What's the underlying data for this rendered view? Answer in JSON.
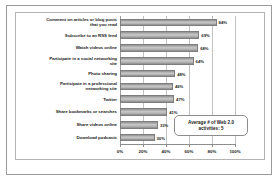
{
  "chart_data": {
    "type": "bar",
    "orientation": "horizontal",
    "title": "",
    "xlabel": "",
    "ylabel": "",
    "xlim": [
      0,
      100
    ],
    "grid": true,
    "legend": false,
    "xticks": [
      "0%",
      "20%",
      "40%",
      "60%",
      "80%",
      "100%"
    ],
    "xtick_values": [
      0,
      20,
      40,
      60,
      80,
      100
    ],
    "categories": [
      "Comment on articles or blog posts that you read",
      "Subscribe to an RSS feed",
      "Watch videos online",
      "Participate in a social networking site",
      "Photo sharing",
      "Participate in a professional networking site",
      "Twitter",
      "Share bookmarks or searches",
      "Share videos online",
      "Download podcasts"
    ],
    "values": [
      84,
      69,
      68,
      64,
      48,
      46,
      47,
      41,
      33,
      30
    ],
    "value_labels": [
      "84%",
      "69%",
      "68%",
      "64%",
      "48%",
      "46%",
      "47%",
      "41%",
      "33%",
      "30%"
    ],
    "annotations": [
      {
        "text": "Average # of Web 2.0 activities: 5",
        "line1": "Average # of Web 2.0",
        "line2": "activities: 5"
      }
    ],
    "colors": {
      "bar_light": "#c9c9c9",
      "bar_dark": "#8b8b8b",
      "bar_edge": "#7d7d7d",
      "gridline": "#c2c2c2",
      "axis": "#8d8d8d",
      "text": "#1b1b1b",
      "background": "#ffffff",
      "border": "#9a9a9a"
    }
  },
  "category_label_lines": [
    [
      "Comment on articles or blog posts",
      "that you read"
    ],
    [
      "Subscribe to an RSS feed"
    ],
    [
      "Watch videos online"
    ],
    [
      "Participate in a social networking",
      "site"
    ],
    [
      "Photo sharing"
    ],
    [
      "Participate in a professional",
      "networking site"
    ],
    [
      "Twitter"
    ],
    [
      "Share bookmarks or searches"
    ],
    [
      "Share videos online"
    ],
    [
      "Download podcasts"
    ]
  ]
}
